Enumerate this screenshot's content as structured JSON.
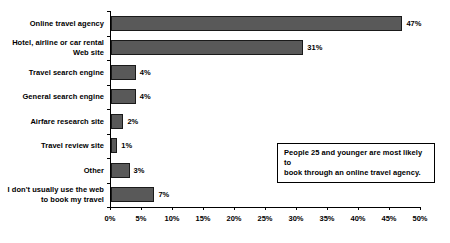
{
  "chart_data": {
    "type": "bar",
    "orientation": "horizontal",
    "title": "",
    "xlabel": "",
    "ylabel": "",
    "xlim": [
      0,
      50
    ],
    "xtick_step": 5,
    "grid": false,
    "legend": null,
    "bar_color": "#595959",
    "bar_border_color": "#1a1a1a",
    "categories": [
      "Online travel agency",
      "Hotel, airline or car rental\nWeb site",
      "Travel search engine",
      "General search engine",
      "Airfare research site",
      "Travel review site",
      "Other",
      "I don't usually use the web\nto book my travel"
    ],
    "values": [
      47,
      31,
      4,
      4,
      2,
      1,
      3,
      7
    ],
    "value_labels": [
      "47%",
      "31%",
      "4%",
      "4%",
      "2%",
      "1%",
      "3%",
      "7%"
    ],
    "xtick_labels": [
      "0%",
      "5%",
      "10%",
      "15%",
      "20%",
      "25%",
      "30%",
      "35%",
      "40%",
      "45%",
      "50%"
    ],
    "xtick_values": [
      0,
      5,
      10,
      15,
      20,
      25,
      30,
      35,
      40,
      45,
      50
    ],
    "annotations": [
      {
        "text": "People 25 and younger are most likely to book through an online travel agency.",
        "line1": "People 25 and younger are most likely to",
        "line2": "book through an online travel agency."
      }
    ]
  }
}
